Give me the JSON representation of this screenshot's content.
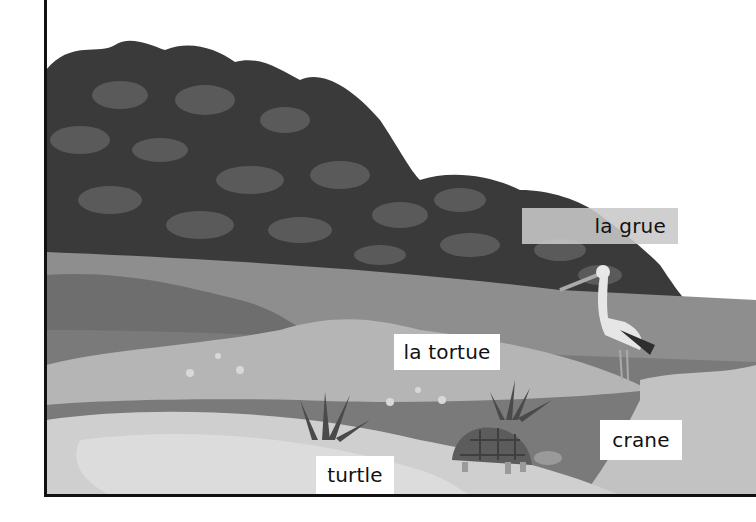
{
  "scene": {
    "description": "Illustrated pond scene with vocabulary labels",
    "colors": {
      "background": "#ffffff",
      "bush_dark": "#3a3a3a",
      "bush_leaf": "#5a5a5a",
      "bank_band": "#8e8e8e",
      "water_dark": "#6e6e6e",
      "water_mid": "#9a9a9a",
      "pond_light": "#b8b8b8",
      "sand": "#d2d2d2",
      "frame": "#111111"
    }
  },
  "labels": {
    "crane_fr": "la grue",
    "turtle_fr": "la tortue",
    "crane_en": "crane",
    "turtle_en": "turtle"
  },
  "figures": {
    "bird": "crane",
    "reptile": "turtle",
    "plants": [
      "grass-tuft-left",
      "grass-tuft-right"
    ],
    "flowers": 6
  }
}
